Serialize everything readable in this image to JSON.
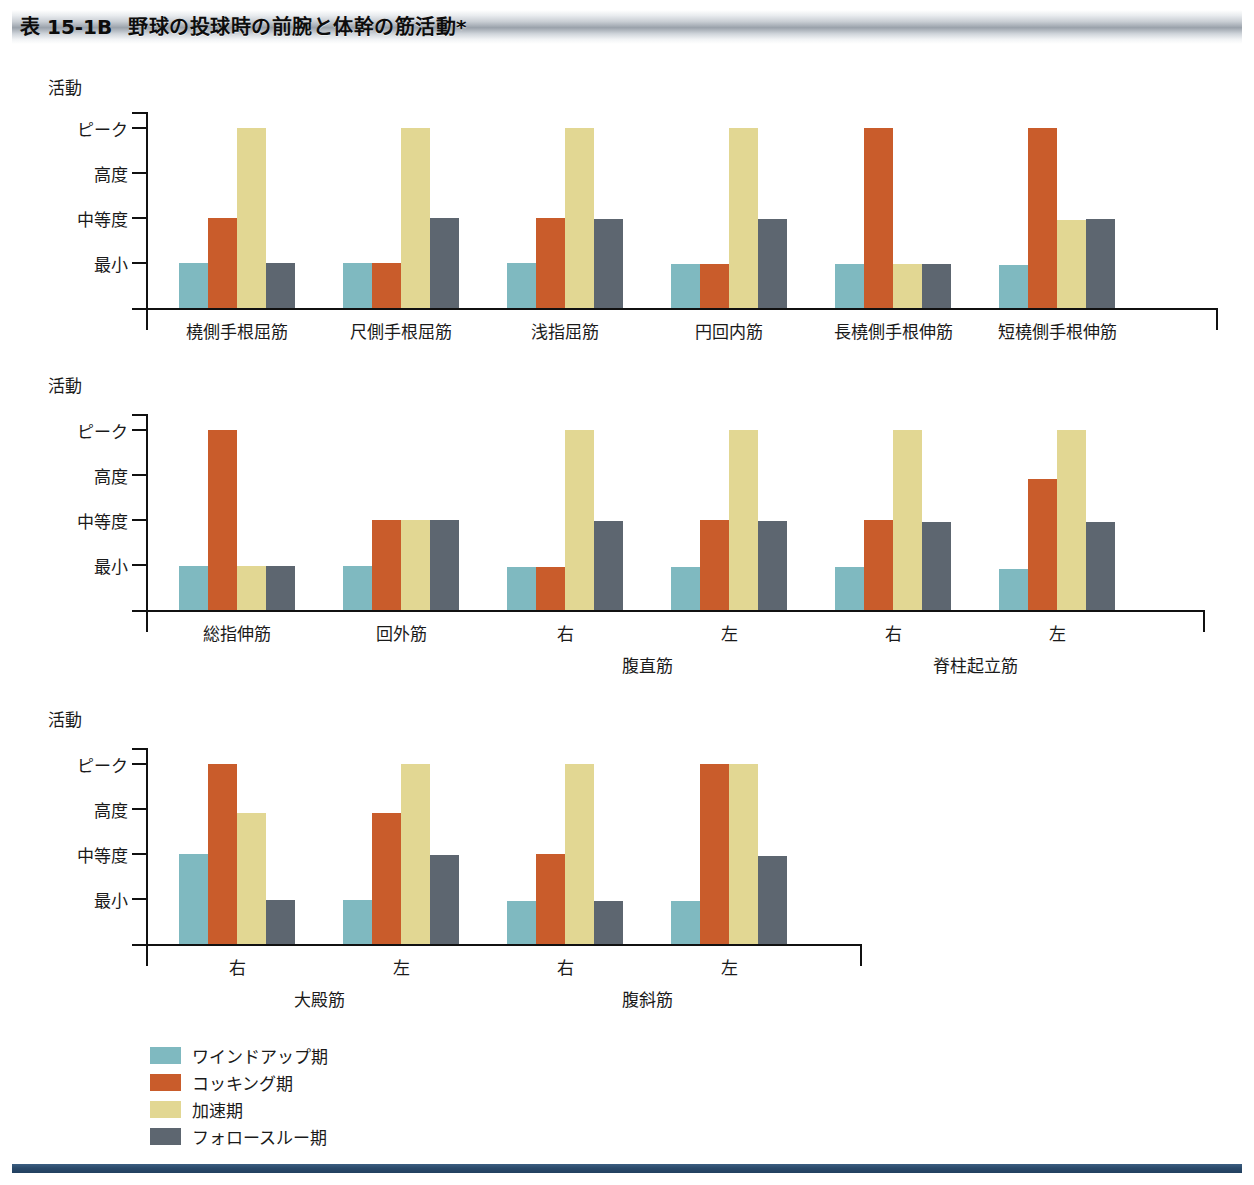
{
  "header": {
    "number": "表 15-1B",
    "title": "野球の投球時の前腕と体幹の筋活動*"
  },
  "axis": {
    "caption": "活動",
    "y_ticks": [
      "ピーク",
      "高度",
      "中等度",
      "最小"
    ]
  },
  "legend": [
    {
      "label": "ワインドアップ期",
      "color": "#7fb9c0"
    },
    {
      "label": "コッキング期",
      "color": "#c95c2b"
    },
    {
      "label": "加速期",
      "color": "#e2d793"
    },
    {
      "label": "フォロースルー期",
      "color": "#5d6670"
    }
  ],
  "colors": {
    "windup": "#7fb9c0",
    "cocking": "#c95c2b",
    "acceleration": "#e2d793",
    "followthrough": "#5d6670",
    "axis": "#111111",
    "banner_dark": "#9aa2ab",
    "footer": "#2b4a6b"
  },
  "chart_data": [
    {
      "type": "bar",
      "title": "野球の投球時の前腕と体幹の筋活動*",
      "ylabel": "活動",
      "ytick_labels": [
        "ピーク",
        "高度",
        "中等度",
        "最小"
      ],
      "ytick_values": [
        4,
        3,
        2,
        1
      ],
      "ylim": [
        0,
        4.35
      ],
      "grid": false,
      "legend_position": "below",
      "categories": [
        "橈側手根屈筋",
        "尺側手根屈筋",
        "浅指屈筋",
        "円回内筋",
        "長橈側手根伸筋",
        "短橈側手根伸筋"
      ],
      "series": [
        {
          "name": "ワインドアップ期",
          "values": [
            1,
            1,
            1,
            0.97,
            0.97,
            0.95
          ]
        },
        {
          "name": "コッキング期",
          "values": [
            2,
            1,
            2,
            0.97,
            4,
            4
          ]
        },
        {
          "name": "加速期",
          "values": [
            4,
            4,
            4,
            4,
            0.97,
            1.95
          ]
        },
        {
          "name": "フォロースルー期",
          "values": [
            1,
            2,
            1.98,
            1.98,
            0.97,
            1.98
          ]
        }
      ]
    },
    {
      "type": "bar",
      "ylabel": "活動",
      "ytick_labels": [
        "ピーク",
        "高度",
        "中等度",
        "最小"
      ],
      "ytick_values": [
        4,
        3,
        2,
        1
      ],
      "ylim": [
        0,
        4.35
      ],
      "grid": false,
      "categories": [
        "総指伸筋",
        "回外筋",
        "右",
        "左",
        "右",
        "左"
      ],
      "group_captions": [
        {
          "label": "腹直筋",
          "spans": [
            2,
            3
          ]
        },
        {
          "label": "脊柱起立筋",
          "spans": [
            4,
            5
          ]
        }
      ],
      "series": [
        {
          "name": "ワインドアップ期",
          "values": [
            0.97,
            0.97,
            0.95,
            0.95,
            0.95,
            0.92
          ]
        },
        {
          "name": "コッキング期",
          "values": [
            4,
            2,
            0.95,
            2,
            2,
            2.9
          ]
        },
        {
          "name": "加速期",
          "values": [
            0.97,
            2,
            4,
            4,
            4,
            4
          ]
        },
        {
          "name": "フォロースルー期",
          "values": [
            0.97,
            2,
            1.98,
            1.98,
            1.95,
            1.95
          ]
        }
      ]
    },
    {
      "type": "bar",
      "ylabel": "活動",
      "ytick_labels": [
        "ピーク",
        "高度",
        "中等度",
        "最小"
      ],
      "ytick_values": [
        4,
        3,
        2,
        1
      ],
      "ylim": [
        0,
        4.35
      ],
      "grid": false,
      "categories": [
        "右",
        "左",
        "右",
        "左"
      ],
      "group_captions": [
        {
          "label": "大殿筋",
          "spans": [
            0,
            1
          ]
        },
        {
          "label": "腹斜筋",
          "spans": [
            2,
            3
          ]
        }
      ],
      "series": [
        {
          "name": "ワインドアップ期",
          "values": [
            2,
            0.97,
            0.95,
            0.95
          ]
        },
        {
          "name": "コッキング期",
          "values": [
            4,
            2.9,
            2,
            4
          ]
        },
        {
          "name": "加速期",
          "values": [
            2.9,
            4,
            4,
            4
          ]
        },
        {
          "name": "フォロースルー期",
          "values": [
            0.97,
            1.98,
            0.95,
            1.95
          ]
        }
      ]
    }
  ]
}
